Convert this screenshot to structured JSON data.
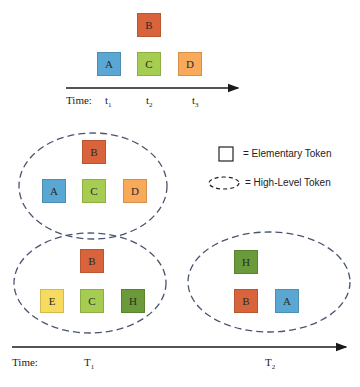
{
  "colors": {
    "A": "#5ba7d3",
    "B": "#d9643c",
    "C": "#a6cc52",
    "D": "#f8a95a",
    "E": "#f7db5e",
    "H": "#6a9a3a",
    "ellipse": "#4a5470",
    "axis": "#1a1a1a"
  },
  "top_timeline": {
    "time_label": "Time:",
    "ticks": [
      {
        "base": "t",
        "sub": "1"
      },
      {
        "base": "t",
        "sub": "2"
      },
      {
        "base": "t",
        "sub": "3"
      }
    ],
    "tokens": [
      "B",
      "A",
      "C",
      "D"
    ]
  },
  "legend": {
    "elementary": "= Elementary Token",
    "high_level": "= High-Level Token"
  },
  "group1": {
    "tokens": [
      "B",
      "A",
      "C",
      "D"
    ]
  },
  "group2": {
    "tokens": [
      "B",
      "E",
      "C",
      "H"
    ]
  },
  "group3": {
    "tokens": [
      "H",
      "B",
      "A"
    ]
  },
  "bottom_timeline": {
    "time_label": "Time:",
    "ticks": [
      {
        "base": "T",
        "sub": "1"
      },
      {
        "base": "T",
        "sub": "2"
      }
    ]
  }
}
